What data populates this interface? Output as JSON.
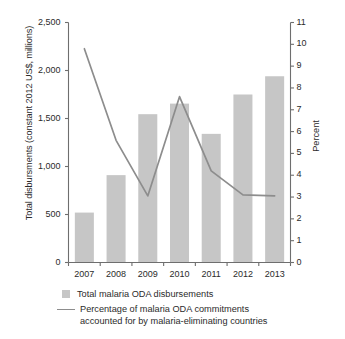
{
  "axes": {
    "left_title": "Total disbursments (constant 2012 US$, millions)",
    "right_title": "Percent",
    "left_ticks": [
      "2,500",
      "2,000",
      "1,500",
      "1,000",
      "500",
      "0"
    ],
    "right_ticks": [
      "11",
      "10",
      "9",
      "8",
      "7",
      "6",
      "5",
      "4",
      "3",
      "2",
      "1",
      "0"
    ]
  },
  "legend": {
    "bar_label": "Total malaria ODA disbursements",
    "line_label_line1": "Percentage of malaria ODA commitments",
    "line_label_line2": "accounted for by malaria-eliminating countries"
  },
  "colors": {
    "bar": "#c6c6c6",
    "line": "#8d8d8d",
    "axis": "#6e6e6e",
    "text": "#2b2b2b"
  },
  "chart_data": {
    "type": "bar",
    "title": "",
    "xlabel": "",
    "ylabel": "Total disbursments (constant 2012 US$, millions)",
    "y2label": "Percent",
    "categories": [
      "2007",
      "2008",
      "2009",
      "2010",
      "2011",
      "2012",
      "2013"
    ],
    "ylim": [
      0,
      2500
    ],
    "y2lim": [
      0,
      11
    ],
    "grid": false,
    "legend_position": "bottom",
    "series": [
      {
        "name": "Total malaria ODA disbursements",
        "type": "bar",
        "axis": "left",
        "color": "#c6c6c6",
        "values": [
          520,
          910,
          1545,
          1655,
          1340,
          1750,
          1940
        ]
      },
      {
        "name": "Percentage of malaria ODA commitments accounted for by malaria-eliminating countries",
        "type": "line",
        "axis": "right",
        "color": "#8d8d8d",
        "values": [
          9.8,
          5.6,
          3.05,
          7.6,
          4.2,
          3.1,
          3.05
        ]
      }
    ]
  }
}
